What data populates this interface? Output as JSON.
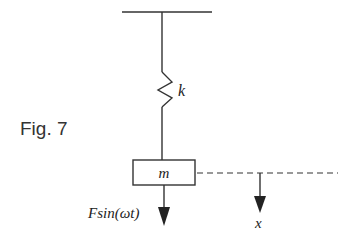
{
  "figure": {
    "label": "Fig. 7",
    "spring_label": "k",
    "mass_label": "m",
    "force_label": "Fsin(ωt)",
    "displacement_label": "x",
    "colors": {
      "stroke": "#333333",
      "background": "#ffffff"
    }
  }
}
